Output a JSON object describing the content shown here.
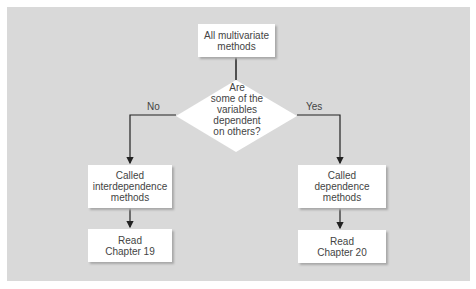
{
  "diagram": {
    "start": {
      "lines": [
        "All multivariate",
        "methods"
      ]
    },
    "decision": {
      "lines": [
        "Are",
        "some of the",
        "variables",
        "dependent",
        "on others?"
      ]
    },
    "branches": {
      "no_label": "No",
      "yes_label": "Yes"
    },
    "left": {
      "method": {
        "lines": [
          "Called",
          "interdependence",
          "methods"
        ]
      },
      "read": {
        "lines": [
          "Read",
          "Chapter 19"
        ]
      }
    },
    "right": {
      "method": {
        "lines": [
          "Called",
          "dependence",
          "methods"
        ]
      },
      "read": {
        "lines": [
          "Read",
          "Chapter 20"
        ]
      }
    },
    "colors": {
      "background": "#d9d9d9",
      "box": "#ffffff",
      "line": "#222222"
    }
  }
}
